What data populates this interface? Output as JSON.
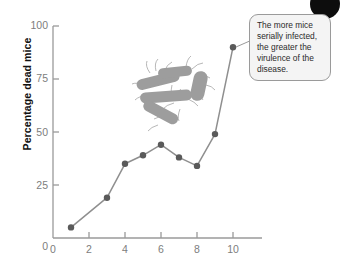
{
  "figure": {
    "name": "virulence-serial-passage-chart",
    "callout": {
      "text": "The more mice serially infected, the greater the virulence of the disease.",
      "border_color": "#9a9a9a",
      "fill_color": "#f4f4f4"
    },
    "illustration": {
      "name": "bacteria-illustration",
      "description": "rod-shaped flagellated bacteria",
      "color": "#9d9d9d"
    },
    "decoration": {
      "name": "corner-blob",
      "color": "#0d0d0d"
    }
  },
  "chart_data": {
    "type": "line",
    "title": "",
    "xlabel": "",
    "ylabel": "Percentage dead mice",
    "x": [
      1,
      3,
      4,
      5,
      6,
      7,
      8,
      9,
      10
    ],
    "values": [
      5,
      19,
      35,
      39,
      44,
      38,
      34,
      49,
      90
    ],
    "series": [
      {
        "name": "Percentage dead mice",
        "x": [
          1,
          3,
          4,
          5,
          6,
          7,
          8,
          9,
          10
        ],
        "values": [
          5,
          19,
          35,
          39,
          44,
          38,
          34,
          49,
          90
        ]
      }
    ],
    "xlim": [
      0,
      11.5
    ],
    "ylim": [
      0,
      100
    ],
    "xticks": [
      0,
      2,
      4,
      6,
      8,
      10
    ],
    "yticks": [
      0,
      25,
      50,
      75,
      100
    ],
    "xtick_labels": [
      "0",
      "2",
      "4",
      "6",
      "8",
      "10"
    ],
    "ytick_labels": [
      "0",
      "25",
      "50",
      "75",
      "100"
    ],
    "grid": false,
    "legend": false,
    "line_color": "#8f8f8f",
    "marker_color": "#5a5a5a",
    "axis_color": "#9a9a9a",
    "tick_label_color": "#7d7d7d"
  }
}
